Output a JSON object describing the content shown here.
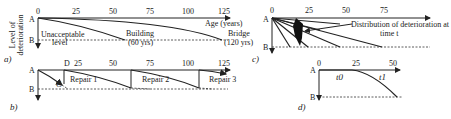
{
  "y_axis_label": [
    "Level of",
    "deterioration"
  ],
  "panels": {
    "a": {
      "label": "a)",
      "point_a": "A",
      "point_b": "B",
      "x_ticks": [
        "0",
        "25",
        "50",
        "75",
        "100",
        "125"
      ],
      "x_axis_title": "Age (years)",
      "unacceptable_label": [
        "Unacceptable",
        "level"
      ],
      "curves": [
        {
          "name": "Building",
          "life": "(60 yrs)"
        },
        {
          "name": "Bridge",
          "life": "(120 yrs)"
        }
      ]
    },
    "b": {
      "label": "b)",
      "point_a": "A",
      "point_b": "B",
      "point_c": "C",
      "point_d": "D",
      "x_ticks": [
        "25",
        "50",
        "75",
        "100",
        "125"
      ],
      "repairs": [
        "Repair 1",
        "Repair 2",
        "Repair 3"
      ]
    },
    "c": {
      "label": "c)",
      "point_a": "A",
      "point_b": "B",
      "x_ticks": [
        "0",
        "25",
        "50",
        "75"
      ],
      "annotation": [
        "Distribution of deterioration at",
        "time t"
      ]
    },
    "d": {
      "label": "d)",
      "point_a": "A",
      "point_b": "B",
      "x_ticks": [
        "0",
        "25",
        "50"
      ],
      "phase_labels": [
        "t0",
        "t1"
      ]
    }
  }
}
